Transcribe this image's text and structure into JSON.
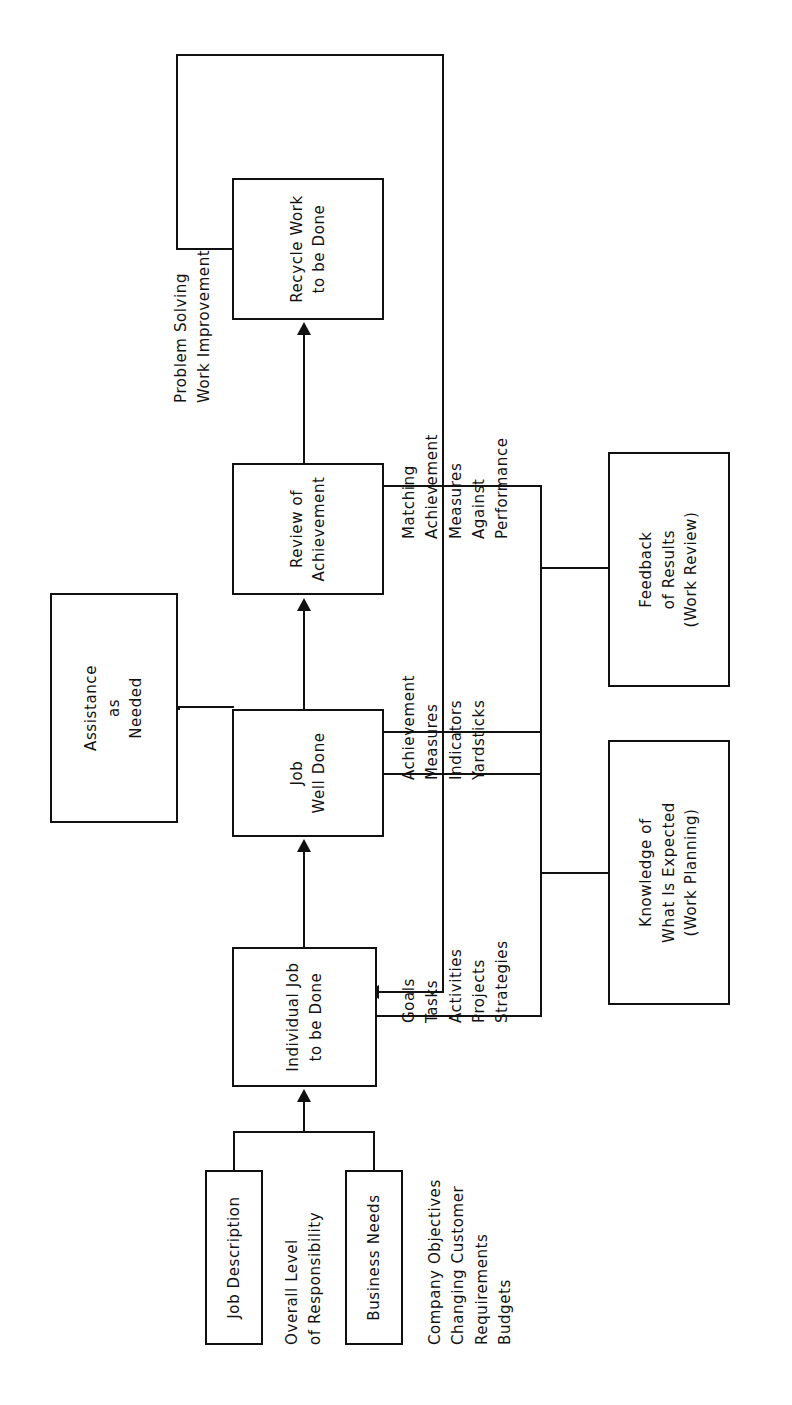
{
  "diagram": {
    "orientation": "rotated-90-ccw",
    "ink_color": "#111111",
    "page_color": "#ffffff",
    "nodes": {
      "job_description": {
        "label": "Job Description"
      },
      "business_needs": {
        "label": "Business Needs"
      },
      "individual_job": {
        "label": "Individual Job\nto be Done"
      },
      "job_well_done": {
        "label": "Job\nWell Done"
      },
      "review_of_achievement": {
        "label": "Review of\nAchievement"
      },
      "recycle_work": {
        "label": "Recycle Work\nto be Done"
      },
      "knowledge_expected": {
        "label": "Knowledge of\nWhat Is Expected\n(Work Planning)"
      },
      "feedback_results": {
        "label": "Feedback\nof Results\n(Work Review)"
      },
      "assistance": {
        "label": "Assistance\nas\nNeeded"
      }
    },
    "annotations": {
      "overall_level": "Overall Level\nof Responsibility",
      "business_inputs": "Company Objectives\nChanging Customer\nRequirements\nBudgets",
      "job_elements": "Goals\nTasks\nActivities\nProjects\nStrategies",
      "achievement_measures": "Achievement\nMeasures\nIndicators\nYardsticks",
      "matching": "Matching\nAchievement\nMeasures\nAgainst\nPerformance",
      "recycle_outputs": "Problem Solving\nWork Improvement"
    }
  }
}
